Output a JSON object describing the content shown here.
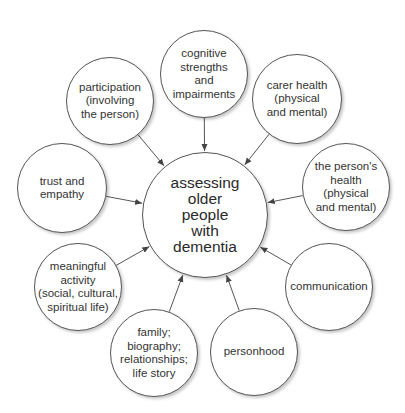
{
  "diagram": {
    "center": {
      "label": "assessing\nolder\npeople\nwith\ndementia",
      "cx": 205,
      "cy": 215,
      "r": 63
    },
    "nodes": [
      {
        "id": "cognitive",
        "label": "cognitive\nstrengths\nand\nimpairments",
        "cx": 204,
        "cy": 74,
        "r": 44
      },
      {
        "id": "carer-health",
        "label": "carer health\n(physical\nand mental)",
        "cx": 297,
        "cy": 99,
        "r": 45
      },
      {
        "id": "persons-health",
        "label": "the person's\nhealth\n(physical\nand mental)",
        "cx": 346,
        "cy": 187,
        "r": 44
      },
      {
        "id": "communication",
        "label": "communication",
        "cx": 329,
        "cy": 287,
        "r": 44
      },
      {
        "id": "personhood",
        "label": "personhood",
        "cx": 254,
        "cy": 352,
        "r": 44
      },
      {
        "id": "family",
        "label": "family;\nbiography;\nrelationships;\nlife story",
        "cx": 154,
        "cy": 353,
        "r": 44
      },
      {
        "id": "meaningful-activity",
        "label": "meaningful\nactivity\n(social, cultural,\nspiritual life)",
        "cx": 78,
        "cy": 287,
        "r": 44
      },
      {
        "id": "trust-empathy",
        "label": "trust and\nempathy",
        "cx": 62,
        "cy": 188,
        "r": 45
      },
      {
        "id": "participation",
        "label": "participation\n(involving\nthe person)",
        "cx": 110,
        "cy": 101,
        "r": 44
      }
    ],
    "colors": {
      "stroke": "#555555",
      "text": "#333333",
      "background": "#ffffff"
    }
  }
}
